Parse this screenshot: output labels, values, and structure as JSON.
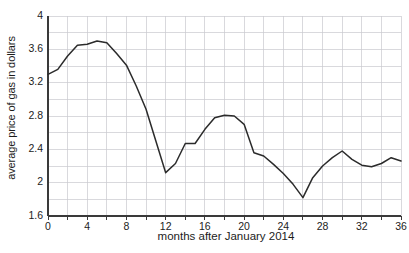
{
  "chart_data": {
    "type": "line",
    "title": "",
    "xlabel": "months after January 2014",
    "ylabel": "average price of gas in dollars",
    "xlim": [
      0,
      36
    ],
    "ylim": [
      1.6,
      4
    ],
    "grid": true,
    "legend": null,
    "x_tick_labels": [
      "0",
      "4",
      "8",
      "12",
      "16",
      "20",
      "24",
      "28",
      "32",
      "36"
    ],
    "x_tick_values": [
      0,
      4,
      8,
      12,
      16,
      20,
      24,
      28,
      32,
      36
    ],
    "x_minor_step": 2,
    "y_tick_labels": [
      "1.6",
      "2",
      "2.4",
      "2.8",
      "3.2",
      "3.6",
      "4"
    ],
    "y_tick_values": [
      1.6,
      2,
      2.4,
      2.8,
      3.2,
      3.6,
      4
    ],
    "y_minor_step": 0.2,
    "line_color": "#2b2b2b",
    "grid_color": "#c9c9cf",
    "axis_color": "#3a3a3a",
    "x": [
      0,
      1,
      2,
      3,
      4,
      5,
      6,
      7,
      8,
      9,
      10,
      11,
      12,
      13,
      14,
      15,
      16,
      17,
      18,
      19,
      20,
      21,
      22,
      23,
      24,
      25,
      26,
      27,
      28,
      29,
      30,
      31,
      32,
      33,
      34,
      35,
      36
    ],
    "values": [
      3.3,
      3.36,
      3.52,
      3.65,
      3.66,
      3.7,
      3.68,
      3.55,
      3.41,
      3.16,
      2.88,
      2.5,
      2.12,
      2.23,
      2.47,
      2.47,
      2.64,
      2.78,
      2.81,
      2.8,
      2.7,
      2.36,
      2.32,
      2.22,
      2.11,
      1.98,
      1.82,
      2.06,
      2.2,
      2.3,
      2.38,
      2.28,
      2.21,
      2.19,
      2.23,
      2.3,
      2.26
    ],
    "series_name": "average price of gas"
  }
}
